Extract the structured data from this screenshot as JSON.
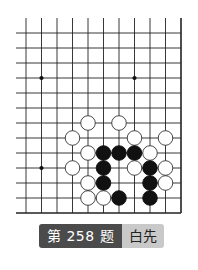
{
  "problem": {
    "number_label": "第 258 题",
    "turn_label": "白先"
  },
  "board": {
    "cols": 11,
    "rows": 13,
    "x0": 26,
    "y0": 33,
    "dx": 15.5,
    "dy": 15,
    "left_extend": 16,
    "top_extend": 18,
    "right_edge": true,
    "bottom_edge": true,
    "line_color": "#222222",
    "star_points": [
      {
        "col": 1,
        "row": 3
      },
      {
        "col": 7,
        "row": 3
      },
      {
        "col": 1,
        "row": 9
      }
    ],
    "stones": [
      {
        "color": "white",
        "col": 4,
        "row": 6
      },
      {
        "color": "white",
        "col": 6,
        "row": 6
      },
      {
        "color": "white",
        "col": 3,
        "row": 7
      },
      {
        "color": "white",
        "col": 7,
        "row": 7
      },
      {
        "color": "white",
        "col": 9,
        "row": 7
      },
      {
        "color": "white",
        "col": 4,
        "row": 8
      },
      {
        "color": "black",
        "col": 5,
        "row": 8
      },
      {
        "color": "black",
        "col": 6,
        "row": 8
      },
      {
        "color": "black",
        "col": 7,
        "row": 8
      },
      {
        "color": "white",
        "col": 8,
        "row": 8
      },
      {
        "color": "white",
        "col": 3,
        "row": 9
      },
      {
        "color": "black",
        "col": 5,
        "row": 9
      },
      {
        "color": "white",
        "col": 7,
        "row": 9
      },
      {
        "color": "black",
        "col": 8,
        "row": 9
      },
      {
        "color": "white",
        "col": 9,
        "row": 9
      },
      {
        "color": "white",
        "col": 4,
        "row": 10
      },
      {
        "color": "black",
        "col": 5,
        "row": 10
      },
      {
        "color": "black",
        "col": 8,
        "row": 10
      },
      {
        "color": "white",
        "col": 9,
        "row": 10
      },
      {
        "color": "white",
        "col": 4,
        "row": 11
      },
      {
        "color": "white",
        "col": 5,
        "row": 11
      },
      {
        "color": "black",
        "col": 6,
        "row": 11
      },
      {
        "color": "black",
        "col": 8,
        "row": 11
      }
    ]
  }
}
